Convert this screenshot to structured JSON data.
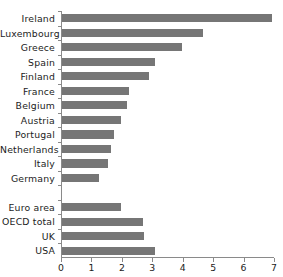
{
  "chart_data": {
    "type": "bar",
    "orientation": "horizontal",
    "title": "",
    "subtitle": "",
    "xlabel": "",
    "ylabel": "",
    "xlim": [
      0,
      7
    ],
    "ylim": null,
    "grid": false,
    "legend": null,
    "legend_position": "none",
    "xticks": [
      0,
      1,
      2,
      3,
      4,
      5,
      6,
      7
    ],
    "xtick_labels": [
      "0",
      "1",
      "2",
      "3",
      "4",
      "5",
      "6",
      "7"
    ],
    "bar_color": "#767676",
    "axis_color": "#8a8a8a",
    "text_color": "#1c1c1c",
    "categories": [
      "Ireland",
      "Luxembourg",
      "Greece",
      "Spain",
      "Finland",
      "France",
      "Belgium",
      "Austria",
      "Portugal",
      "Netherlands",
      "Italy",
      "Germany",
      "",
      "Euro area",
      "OECD total",
      "UK",
      "USA"
    ],
    "values": [
      6.9,
      4.65,
      3.95,
      3.05,
      2.85,
      2.2,
      2.15,
      1.95,
      1.7,
      1.6,
      1.5,
      1.2,
      null,
      1.95,
      2.65,
      2.7,
      3.05
    ],
    "separator_index": 12,
    "annotations": []
  }
}
